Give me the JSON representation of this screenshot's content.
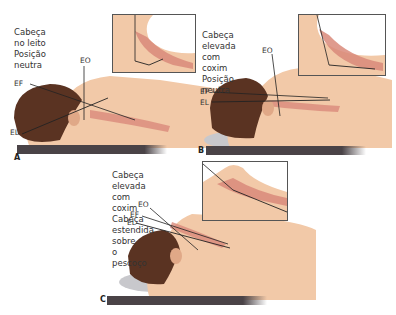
{
  "panels": [
    {
      "letter": "A",
      "caption_line1": "Cabeça no leito",
      "caption_line2": "Posição neutra",
      "labels": {
        "eo": "EO",
        "ef": "EF",
        "el": "EL"
      }
    },
    {
      "letter": "B",
      "caption_line1": "Cabeça elevada com coxim",
      "caption_line2": "Posição neutra",
      "labels": {
        "eo": "EO",
        "ef": "EF",
        "el": "EL"
      }
    },
    {
      "letter": "C",
      "caption_line1": "Cabeça elevada com coxim",
      "caption_line2": "Cabeça estendida sobre",
      "caption_line3": "o pescoço",
      "labels": {
        "eo": "EO",
        "ef": "EF",
        "el": "EL"
      }
    }
  ],
  "colors": {
    "skin": "#f2c9a8",
    "skin_shadow": "#e0a887",
    "hair": "#5a3322",
    "airway": "#d98a7a",
    "pillow": "#c8c8cc",
    "bed": "#4a4347",
    "axis_line": "#222222",
    "inset_border": "#555555"
  }
}
